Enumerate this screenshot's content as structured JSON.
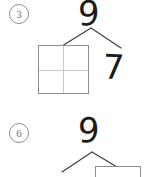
{
  "worksheet": {
    "title": "Number bond practice",
    "background_color": "#ffffff",
    "ink_color": "#1b1b1b",
    "line_color": "#3a3a3a",
    "box_border_color": "#8e8e92",
    "grid_line_color": "#c9c9cd",
    "marker_color": "#6f6f6f"
  },
  "problems": [
    {
      "number": "3",
      "whole": "9",
      "left_part": "",
      "right_part": "7",
      "left_part_is_blank_box": true,
      "right_part_is_blank_box": false,
      "blank_box_style": "2x2-grid"
    },
    {
      "number": "6",
      "whole": "9",
      "left_part": "",
      "right_part": "",
      "left_part_is_blank_box": false,
      "right_part_is_blank_box": true,
      "blank_box_style": "plain",
      "clipped_at_bottom": true
    }
  ]
}
